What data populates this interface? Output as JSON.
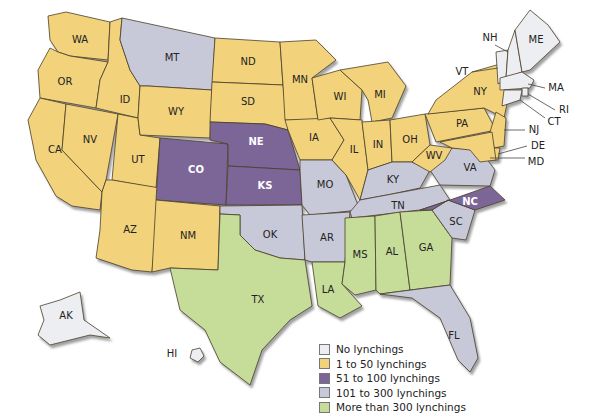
{
  "categories": {
    "none": {
      "label": "No lynchings",
      "color": "#eceef2"
    },
    "c1_50": {
      "label": "1 to 50 lynchings",
      "color": "#f2d27a"
    },
    "c51_100": {
      "label": "51 to 100 lynchings",
      "color": "#7c6698"
    },
    "c101_300": {
      "label": "101 to 300 lynchings",
      "color": "#c8c9d8"
    },
    "c300p": {
      "label": "More than 300 lynchings",
      "color": "#c6dd9a"
    }
  },
  "legend": [
    {
      "key": "none",
      "label": "No lynchings"
    },
    {
      "key": "c1_50",
      "label": "1 to 50 lynchings"
    },
    {
      "key": "c51_100",
      "label": "51 to 100 lynchings"
    },
    {
      "key": "c101_300",
      "label": "101 to 300 lynchings"
    },
    {
      "key": "c300p",
      "label": "More than 300 lynchings"
    }
  ],
  "states": [
    {
      "abbr": "WA",
      "cat": "c1_50"
    },
    {
      "abbr": "OR",
      "cat": "c1_50"
    },
    {
      "abbr": "CA",
      "cat": "c1_50"
    },
    {
      "abbr": "ID",
      "cat": "c1_50"
    },
    {
      "abbr": "NV",
      "cat": "c1_50"
    },
    {
      "abbr": "UT",
      "cat": "c1_50"
    },
    {
      "abbr": "AZ",
      "cat": "c1_50"
    },
    {
      "abbr": "MT",
      "cat": "c101_300"
    },
    {
      "abbr": "WY",
      "cat": "c1_50"
    },
    {
      "abbr": "CO",
      "cat": "c51_100"
    },
    {
      "abbr": "NM",
      "cat": "c1_50"
    },
    {
      "abbr": "ND",
      "cat": "c1_50"
    },
    {
      "abbr": "SD",
      "cat": "c1_50"
    },
    {
      "abbr": "NE",
      "cat": "c51_100"
    },
    {
      "abbr": "KS",
      "cat": "c51_100"
    },
    {
      "abbr": "OK",
      "cat": "c101_300"
    },
    {
      "abbr": "TX",
      "cat": "c300p"
    },
    {
      "abbr": "MN",
      "cat": "c1_50"
    },
    {
      "abbr": "IA",
      "cat": "c1_50"
    },
    {
      "abbr": "MO",
      "cat": "c101_300"
    },
    {
      "abbr": "AR",
      "cat": "c101_300"
    },
    {
      "abbr": "LA",
      "cat": "c300p"
    },
    {
      "abbr": "WI",
      "cat": "c1_50"
    },
    {
      "abbr": "IL",
      "cat": "c1_50"
    },
    {
      "abbr": "MI",
      "cat": "c1_50"
    },
    {
      "abbr": "IN",
      "cat": "c1_50"
    },
    {
      "abbr": "OH",
      "cat": "c1_50"
    },
    {
      "abbr": "KY",
      "cat": "c101_300"
    },
    {
      "abbr": "TN",
      "cat": "c101_300"
    },
    {
      "abbr": "MS",
      "cat": "c300p"
    },
    {
      "abbr": "AL",
      "cat": "c300p"
    },
    {
      "abbr": "GA",
      "cat": "c300p"
    },
    {
      "abbr": "FL",
      "cat": "c101_300"
    },
    {
      "abbr": "SC",
      "cat": "c101_300"
    },
    {
      "abbr": "NC",
      "cat": "c51_100"
    },
    {
      "abbr": "VA",
      "cat": "c101_300"
    },
    {
      "abbr": "WV",
      "cat": "c1_50"
    },
    {
      "abbr": "PA",
      "cat": "c1_50"
    },
    {
      "abbr": "NY",
      "cat": "c1_50"
    },
    {
      "abbr": "NJ",
      "cat": "c1_50"
    },
    {
      "abbr": "DE",
      "cat": "c1_50"
    },
    {
      "abbr": "MD",
      "cat": "c1_50"
    },
    {
      "abbr": "VT",
      "cat": "none"
    },
    {
      "abbr": "NH",
      "cat": "none"
    },
    {
      "abbr": "ME",
      "cat": "none"
    },
    {
      "abbr": "MA",
      "cat": "none"
    },
    {
      "abbr": "RI",
      "cat": "none"
    },
    {
      "abbr": "CT",
      "cat": "none"
    },
    {
      "abbr": "AK",
      "cat": "none"
    },
    {
      "abbr": "HI",
      "cat": "none"
    }
  ]
}
